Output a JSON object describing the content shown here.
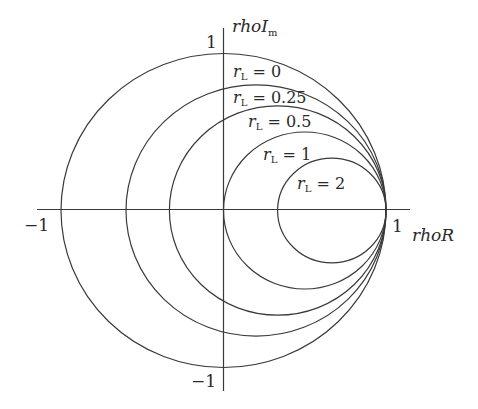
{
  "diagram": {
    "type": "smith-chart-resistance-circles",
    "axes": {
      "horizontal": {
        "label": "rhoR",
        "tick_positive": "1",
        "tick_negative": "−1"
      },
      "vertical": {
        "label_main": "rhoI",
        "label_sub": "m",
        "tick_positive": "1",
        "tick_negative": "−1"
      }
    },
    "circles": [
      {
        "name": "rL",
        "sub": "L",
        "prefix": "r",
        "value": "0",
        "label": "r_L = 0"
      },
      {
        "name": "rL",
        "sub": "L",
        "prefix": "r",
        "value": "0.25",
        "label": "r_L = 0.25"
      },
      {
        "name": "rL",
        "sub": "L",
        "prefix": "r",
        "value": "0.5",
        "label": "r_L = 0.5"
      },
      {
        "name": "rL",
        "sub": "L",
        "prefix": "r",
        "value": "1",
        "label": "r_L = 1"
      },
      {
        "name": "rL",
        "sub": "L",
        "prefix": "r",
        "value": "2",
        "label": "r_L = 2"
      }
    ],
    "equals": "=",
    "colors": {
      "line": "#3a3a3a",
      "text": "#2a2a2a",
      "background": "#ffffff"
    }
  }
}
